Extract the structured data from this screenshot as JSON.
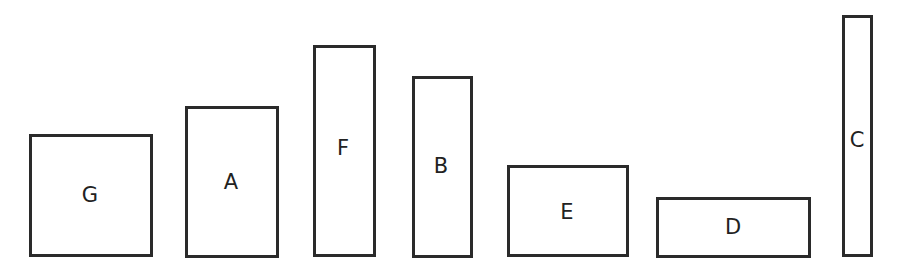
{
  "diagram": {
    "type": "rectangles",
    "stroke_color": "#2a2a2a",
    "background": "#ffffff",
    "rectangles": [
      {
        "label": "G",
        "x": 29,
        "y": 134,
        "w": 124,
        "h": 123,
        "label_x": 90,
        "label_y": 195
      },
      {
        "label": "A",
        "x": 185,
        "y": 106,
        "w": 94,
        "h": 152,
        "label_x": 231,
        "label_y": 182
      },
      {
        "label": "F",
        "x": 313,
        "y": 45,
        "w": 63,
        "h": 212,
        "label_x": 343,
        "label_y": 148
      },
      {
        "label": "B",
        "x": 412,
        "y": 76,
        "w": 61,
        "h": 182,
        "label_x": 441,
        "label_y": 166
      },
      {
        "label": "E",
        "x": 507,
        "y": 165,
        "w": 122,
        "h": 92,
        "label_x": 567,
        "label_y": 212
      },
      {
        "label": "D",
        "x": 656,
        "y": 197,
        "w": 155,
        "h": 61,
        "label_x": 733,
        "label_y": 227
      },
      {
        "label": "C",
        "x": 842,
        "y": 15,
        "w": 31,
        "h": 242,
        "label_x": 857,
        "label_y": 140
      }
    ]
  }
}
